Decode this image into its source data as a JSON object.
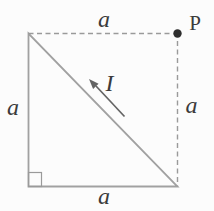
{
  "diagram": {
    "labels": {
      "side_top": "a",
      "side_left": "a",
      "side_right": "a",
      "side_bottom": "a",
      "current": "I",
      "point": "P"
    },
    "colors": {
      "background": "#fcfcfc",
      "solid_line": "#a1a1a1",
      "dashed_line": "#9a9a9a",
      "right_angle_marker": "#9a9a9a",
      "arrow": "#646464",
      "label_text": "#3b3b3b",
      "point_dot": "#2e2e2e"
    }
  }
}
